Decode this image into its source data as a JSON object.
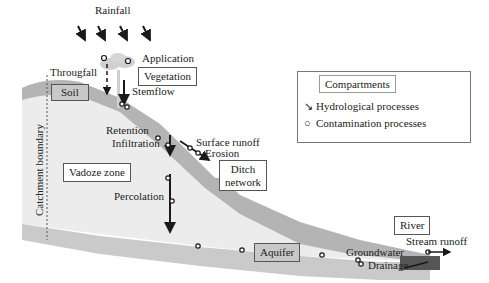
{
  "diagram": {
    "labels": {
      "rainfall": "Rainfall",
      "application": "Application",
      "througfall": "Througfall",
      "stemflow": "Stemflow",
      "retention": "Retention",
      "infiltration": "Infiltration",
      "surface_runoff": "Surface runoff",
      "erosion": "Erosion",
      "percolation": "Percolation",
      "catchment_boundary": "Catchment boundary",
      "groundwater": "Groundwater",
      "drainage": "Drainage",
      "stream_runoff": "Stream runoff"
    },
    "compartments": {
      "vegetation": "Vegetation",
      "soil": "Soil",
      "vadoze_zone": "Vadoze zone",
      "ditch_network": [
        "Ditch",
        "network"
      ],
      "aquifer": "Aquifer",
      "river": "River"
    },
    "legend": {
      "title": "Compartments",
      "hydrological": "Hydrological processes",
      "contamination": "Contamination processes"
    },
    "colors": {
      "soil": "#b4b4b4",
      "vadose": "#ececec",
      "aquifer": "#c4c4c4",
      "river": "#555555",
      "arrow": "#1a1a1a"
    }
  }
}
